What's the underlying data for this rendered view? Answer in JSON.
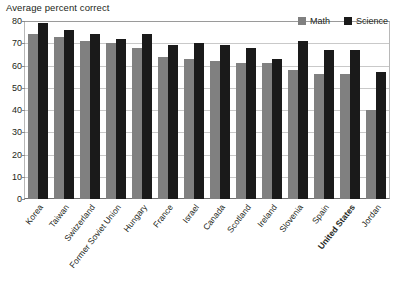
{
  "chart_data": {
    "type": "bar",
    "title": "Average percent correct",
    "xlabel": "",
    "ylabel": "",
    "ylim": [
      0,
      80
    ],
    "ytick_values": [
      80,
      70,
      60,
      50,
      40,
      30,
      20,
      10,
      0
    ],
    "ytick_labels": [
      "80",
      "70",
      "60",
      "50",
      "40",
      "30",
      "20",
      "10",
      "0"
    ],
    "grid": true,
    "legend_position": "top-right",
    "categories": [
      "Korea",
      "Taiwan",
      "Switzerland",
      "Former Soviet Union",
      "Hungary",
      "France",
      "Israel",
      "Canada",
      "Scotland",
      "Ireland",
      "Slovenia",
      "Spain",
      "United States",
      "Jordan"
    ],
    "highlighted_category": "United States",
    "series": [
      {
        "name": "Math",
        "color": "#808080",
        "values": [
          74,
          73,
          71,
          70,
          68,
          64,
          63,
          62,
          61,
          61,
          58,
          56,
          56,
          40
        ]
      },
      {
        "name": "Science",
        "color": "#1a1a1a",
        "values": [
          79,
          76,
          74,
          72,
          74,
          69,
          70,
          69,
          68,
          63,
          71,
          67,
          67,
          57
        ]
      }
    ]
  },
  "legend": {
    "items": [
      {
        "label": "Math",
        "color": "#808080"
      },
      {
        "label": "Science",
        "color": "#1a1a1a"
      }
    ]
  }
}
